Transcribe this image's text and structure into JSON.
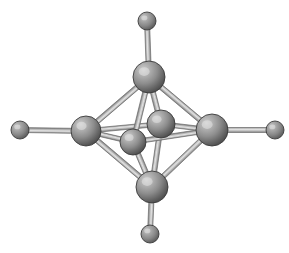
{
  "figure": {
    "background_color": "#ffffff",
    "width": 289,
    "height": 253
  },
  "palette": {
    "sphere_highlight": "#c9c9c9",
    "sphere_mid": "#8f8f8f",
    "sphere_dark": "#4e4e4e",
    "sphere_edge": "#3b3b3b",
    "bond_light": "#d8d8d8",
    "bond_mid": "#a8a8a8",
    "bond_edge": "#6f6f6f",
    "background": "#ffffff"
  },
  "atoms": [
    {
      "id": "core-top",
      "label": "core atom (top vertex)",
      "cx": 149,
      "cy": 77,
      "r": 16,
      "kind": "large",
      "z": 6
    },
    {
      "id": "core-left",
      "label": "core atom (left vertex)",
      "cx": 86,
      "cy": 131,
      "r": 15,
      "kind": "large",
      "z": 5
    },
    {
      "id": "core-right",
      "label": "core atom (right vertex)",
      "cx": 212,
      "cy": 130,
      "r": 16,
      "kind": "large",
      "z": 5
    },
    {
      "id": "core-bottom",
      "label": "core atom (bottom vertex)",
      "cx": 152,
      "cy": 187,
      "r": 16,
      "kind": "large",
      "z": 6
    },
    {
      "id": "core-back",
      "label": "core atom (rear vertex)",
      "cx": 161,
      "cy": 124,
      "r": 14,
      "kind": "large",
      "z": 3
    },
    {
      "id": "core-front",
      "label": "core atom (front vertex)",
      "cx": 133,
      "cy": 142,
      "r": 13,
      "kind": "large",
      "z": 8
    },
    {
      "id": "ligand-top",
      "label": "terminal ligand atom (top)",
      "cx": 147,
      "cy": 21,
      "r": 9,
      "kind": "small",
      "z": 2
    },
    {
      "id": "ligand-left",
      "label": "terminal ligand atom (left)",
      "cx": 20,
      "cy": 130,
      "r": 9,
      "kind": "small",
      "z": 2
    },
    {
      "id": "ligand-right",
      "label": "terminal ligand atom (right)",
      "cx": 275,
      "cy": 130,
      "r": 9,
      "kind": "small",
      "z": 2
    },
    {
      "id": "ligand-bottom",
      "label": "terminal ligand atom (bottom)",
      "cx": 150,
      "cy": 234,
      "r": 9,
      "kind": "small",
      "z": 2
    }
  ],
  "bonds": [
    {
      "id": "b-top-left",
      "from": "core-top",
      "to": "core-left",
      "width": 5,
      "z": 1
    },
    {
      "id": "b-top-right",
      "from": "core-top",
      "to": "core-right",
      "width": 5,
      "z": 1
    },
    {
      "id": "b-bottom-left",
      "from": "core-bottom",
      "to": "core-left",
      "width": 5,
      "z": 1
    },
    {
      "id": "b-bottom-right",
      "from": "core-bottom",
      "to": "core-right",
      "width": 5,
      "z": 1
    },
    {
      "id": "b-top-back",
      "from": "core-top",
      "to": "core-back",
      "width": 5,
      "z": 2
    },
    {
      "id": "b-bottom-back",
      "from": "core-bottom",
      "to": "core-back",
      "width": 5,
      "z": 2
    },
    {
      "id": "b-left-back",
      "from": "core-left",
      "to": "core-back",
      "width": 4.5,
      "z": 2
    },
    {
      "id": "b-right-back",
      "from": "core-right",
      "to": "core-back",
      "width": 4.5,
      "z": 2
    },
    {
      "id": "b-top-front",
      "from": "core-top",
      "to": "core-front",
      "width": 5,
      "z": 7
    },
    {
      "id": "b-bottom-front",
      "from": "core-bottom",
      "to": "core-front",
      "width": 5,
      "z": 7
    },
    {
      "id": "b-left-front",
      "from": "core-left",
      "to": "core-front",
      "width": 4.5,
      "z": 7
    },
    {
      "id": "b-right-front",
      "from": "core-right",
      "to": "core-front",
      "width": 4.5,
      "z": 4
    },
    {
      "id": "b-lig-top",
      "from": "core-top",
      "to": "ligand-top",
      "width": 5,
      "z": 1
    },
    {
      "id": "b-lig-left",
      "from": "core-left",
      "to": "ligand-left",
      "width": 5,
      "z": 1
    },
    {
      "id": "b-lig-right",
      "from": "core-right",
      "to": "ligand-right",
      "width": 5,
      "z": 1
    },
    {
      "id": "b-lig-bottom",
      "from": "core-bottom",
      "to": "ligand-bottom",
      "width": 5,
      "z": 1
    }
  ]
}
